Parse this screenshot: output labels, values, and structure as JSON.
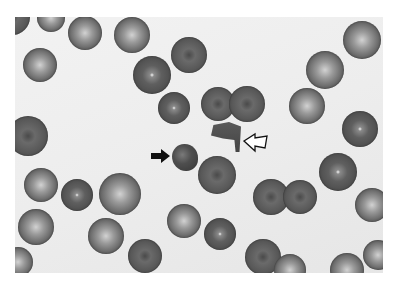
{
  "figure": {
    "background_color": "#ffffff",
    "photo_background": "#ededed"
  },
  "annotations": [
    {
      "type": "arrow",
      "style": "solid",
      "color": "#111111",
      "direction": "right",
      "target": "irregular granular cell"
    },
    {
      "type": "arrow",
      "style": "outline",
      "color": "#111111",
      "direction": "left",
      "target": "fragmented red cell"
    }
  ],
  "cells": [
    {
      "x": 12,
      "y": 17,
      "r": 18,
      "style": "dark"
    },
    {
      "x": 51,
      "y": 18,
      "r": 14,
      "style": "pale"
    },
    {
      "x": 85,
      "y": 33,
      "r": 17,
      "style": "pale"
    },
    {
      "x": 132,
      "y": 35,
      "r": 18,
      "style": "pale"
    },
    {
      "x": 40,
      "y": 65,
      "r": 17,
      "style": "pale"
    },
    {
      "x": 189,
      "y": 55,
      "r": 18,
      "style": "dark"
    },
    {
      "x": 152,
      "y": 75,
      "r": 19,
      "style": "dot"
    },
    {
      "x": 174,
      "y": 108,
      "r": 16,
      "style": "dot"
    },
    {
      "x": 218,
      "y": 104,
      "r": 17,
      "style": "dark"
    },
    {
      "x": 247,
      "y": 104,
      "r": 18,
      "style": "dark"
    },
    {
      "x": 325,
      "y": 70,
      "r": 19,
      "style": "pale"
    },
    {
      "x": 362,
      "y": 40,
      "r": 19,
      "style": "pale"
    },
    {
      "x": 307,
      "y": 106,
      "r": 18,
      "style": "pale"
    },
    {
      "x": 360,
      "y": 129,
      "r": 18,
      "style": "dot"
    },
    {
      "x": 28,
      "y": 136,
      "r": 20,
      "style": "dark"
    },
    {
      "x": 217,
      "y": 175,
      "r": 19,
      "style": "dark"
    },
    {
      "x": 338,
      "y": 172,
      "r": 19,
      "style": "dot"
    },
    {
      "x": 271,
      "y": 197,
      "r": 18,
      "style": "dark"
    },
    {
      "x": 300,
      "y": 197,
      "r": 17,
      "style": "dark"
    },
    {
      "x": 41,
      "y": 185,
      "r": 17,
      "style": "pale"
    },
    {
      "x": 77,
      "y": 195,
      "r": 16,
      "style": "dot"
    },
    {
      "x": 120,
      "y": 194,
      "r": 21,
      "style": "pale"
    },
    {
      "x": 36,
      "y": 227,
      "r": 18,
      "style": "pale"
    },
    {
      "x": 106,
      "y": 236,
      "r": 18,
      "style": "pale"
    },
    {
      "x": 184,
      "y": 221,
      "r": 17,
      "style": "pale"
    },
    {
      "x": 220,
      "y": 234,
      "r": 16,
      "style": "dot"
    },
    {
      "x": 372,
      "y": 205,
      "r": 17,
      "style": "pale"
    },
    {
      "x": 145,
      "y": 256,
      "r": 17,
      "style": "dark"
    },
    {
      "x": 263,
      "y": 257,
      "r": 18,
      "style": "dark"
    },
    {
      "x": 290,
      "y": 270,
      "r": 16,
      "style": "pale"
    },
    {
      "x": 347,
      "y": 270,
      "r": 17,
      "style": "pale"
    },
    {
      "x": 378,
      "y": 255,
      "r": 15,
      "style": "pale"
    },
    {
      "x": 18,
      "y": 262,
      "r": 15,
      "style": "pale"
    },
    {
      "x": 20,
      "y": 100,
      "r": 0,
      "style": "none"
    }
  ]
}
